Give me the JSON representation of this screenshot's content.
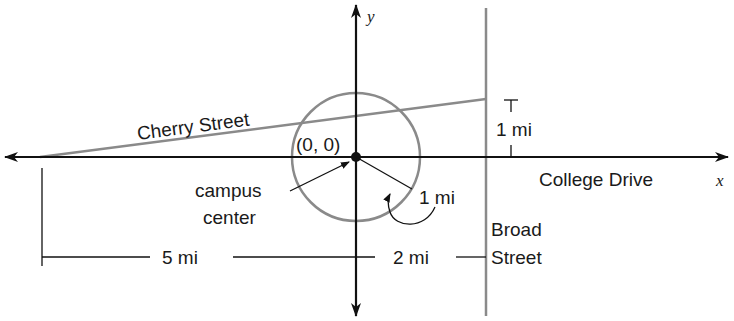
{
  "diagram": {
    "axes": {
      "x_label": "x",
      "y_label": "y"
    },
    "origin_label": "(0, 0)",
    "roads": {
      "horizontal_axis_road": "College Drive",
      "diagonal_road": "Cherry Street",
      "vertical_road_line1": "Broad",
      "vertical_road_line2": "Street"
    },
    "point_label_line1": "campus",
    "point_label_line2": "center",
    "measurements": {
      "radius": "1 mi",
      "cherry_height": "1 mi",
      "left_distance": "5 mi",
      "right_distance": "2 mi"
    },
    "colors": {
      "axis": "#111111",
      "gray": "#8a8a8a"
    }
  }
}
